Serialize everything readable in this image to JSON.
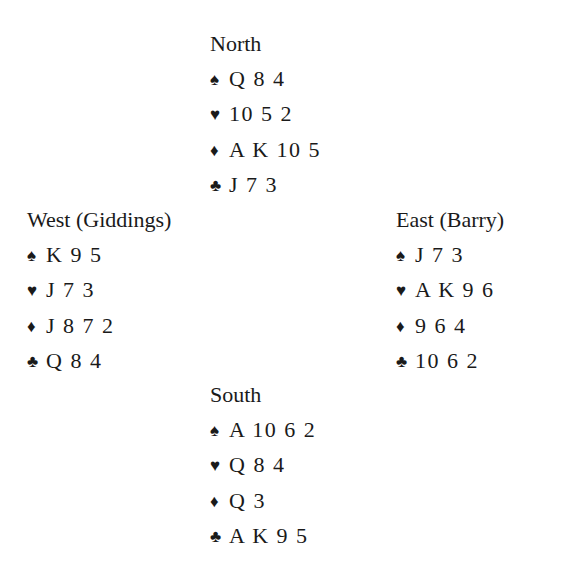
{
  "deal": {
    "north": {
      "label": "North",
      "spades": "Q 8 4",
      "hearts": "10 5 2",
      "diamonds": "A K 10 5",
      "clubs": "J 7 3"
    },
    "west": {
      "label": "West (Giddings)",
      "spades": "K 9 5",
      "hearts": "J 7 3",
      "diamonds": "J 8 7 2",
      "clubs": "Q 8 4"
    },
    "east": {
      "label": "East (Barry)",
      "spades": "J 7 3",
      "hearts": "A K 9 6",
      "diamonds": "9 6 4",
      "clubs": "10 6 2"
    },
    "south": {
      "label": "South",
      "spades": "A 10 6 2",
      "hearts": "Q 8 4",
      "diamonds": "Q 3",
      "clubs": "A K 9 5"
    }
  },
  "suit_symbols": {
    "spades": "♠",
    "hearts": "♥",
    "diamonds": "♦",
    "clubs": "♣"
  },
  "colors": {
    "text": "#1a1a1a",
    "background": "#ffffff"
  }
}
